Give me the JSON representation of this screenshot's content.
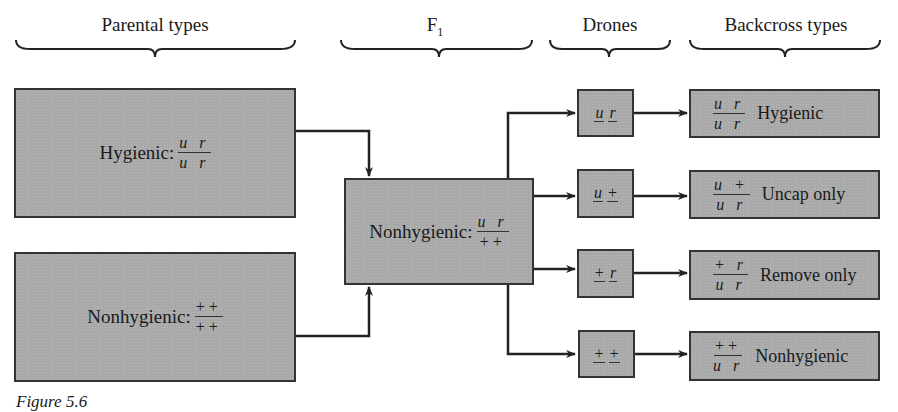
{
  "headers": {
    "parental": "Parental types",
    "f1": "F",
    "f1_sub": "1",
    "drones": "Drones",
    "backcross": "Backcross types"
  },
  "parental": {
    "hygienic": {
      "label": "Hygienic:",
      "num": "u r",
      "den": "u r"
    },
    "nonhygienic": {
      "label": "Nonhygienic:",
      "num": "++",
      "den": "++"
    }
  },
  "f1": {
    "label": "Nonhygienic:",
    "num": "u r",
    "den": "++"
  },
  "drones": [
    {
      "a": "u",
      "b": "r"
    },
    {
      "a": "u",
      "b": "+"
    },
    {
      "a": "+",
      "b": "r"
    },
    {
      "a": "+",
      "b": "+"
    }
  ],
  "backcross": [
    {
      "num": "u r",
      "den": "u r",
      "label": "Hygienic"
    },
    {
      "num": "u +",
      "den": "u r",
      "label": "Uncap only"
    },
    {
      "num": "+ r",
      "den": "u r",
      "label": "Remove only"
    },
    {
      "num": "++",
      "den": "u r",
      "label": "Nonhygienic"
    }
  ],
  "caption": "Figure 5.6"
}
